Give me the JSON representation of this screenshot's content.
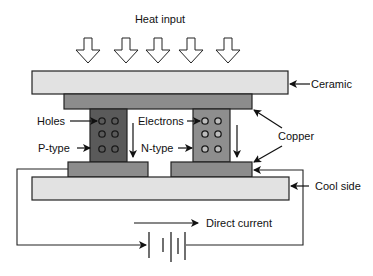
{
  "title": "Heat input",
  "labels": {
    "ceramic": "Ceramic",
    "copper": "Copper",
    "cool_side": "Cool side",
    "holes": "Holes",
    "electrons": "Electrons",
    "p_type": "P-type",
    "n_type": "N-type",
    "direct_current": "Direct current"
  },
  "colors": {
    "ceramic": "#e2e2e2",
    "copper": "#8c8c8c",
    "p_type": "#5a5a5a",
    "n_type": "#8e8e8e",
    "outline": "#222222",
    "electron_fill": "#bdbdbd"
  },
  "heat_arrows_count": 5
}
